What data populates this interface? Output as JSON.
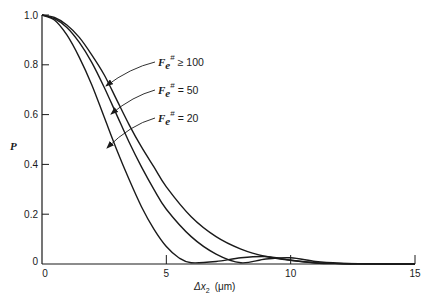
{
  "chart_data": {
    "type": "line",
    "title": "",
    "xlabel": "Δx₂ (μm)",
    "ylabel": "P",
    "xlim": [
      0,
      15
    ],
    "ylim": [
      0,
      1.0
    ],
    "x_ticks": [
      "0",
      "5",
      "10",
      "15"
    ],
    "y_ticks": [
      "0",
      "0.2",
      "0.4",
      "0.6",
      "0.8",
      "1.0"
    ],
    "grid": false,
    "legend_position": "annotations with arrows, center-right",
    "series": [
      {
        "name": "F_e# ≥ 100",
        "label_text": "≥ 100",
        "x": [
          0,
          0.5,
          1,
          1.5,
          2,
          2.5,
          3,
          3.5,
          4,
          4.5,
          5,
          6,
          7,
          8,
          9,
          10,
          11,
          12,
          13,
          14,
          15
        ],
        "y": [
          1.0,
          0.99,
          0.96,
          0.91,
          0.84,
          0.76,
          0.66,
          0.56,
          0.47,
          0.39,
          0.31,
          0.19,
          0.11,
          0.06,
          0.03,
          0.015,
          0.005,
          0.002,
          0.001,
          0.0,
          0.0
        ]
      },
      {
        "name": "F_e# = 50",
        "label_text": "= 50",
        "x": [
          0,
          0.5,
          1,
          1.5,
          2,
          2.5,
          3,
          3.5,
          4,
          4.5,
          5,
          6,
          7,
          8,
          9,
          10,
          11,
          12,
          13,
          14,
          15
        ],
        "y": [
          1.0,
          0.985,
          0.95,
          0.89,
          0.81,
          0.71,
          0.6,
          0.49,
          0.39,
          0.3,
          0.22,
          0.11,
          0.04,
          0.005,
          0.02,
          0.025,
          0.01,
          0.003,
          0.001,
          0.0,
          0.0
        ]
      },
      {
        "name": "F_e# = 20",
        "label_text": "= 20",
        "x": [
          0,
          0.5,
          1,
          1.5,
          2,
          2.5,
          3,
          3.5,
          4,
          4.5,
          5,
          5.5,
          6,
          7,
          8,
          9,
          10,
          11,
          12,
          13,
          14,
          15
        ],
        "y": [
          1.0,
          0.98,
          0.92,
          0.83,
          0.72,
          0.59,
          0.46,
          0.34,
          0.23,
          0.14,
          0.07,
          0.025,
          0.005,
          0.01,
          0.025,
          0.03,
          0.015,
          0.004,
          0.001,
          0.0,
          0.0,
          0.0
        ]
      }
    ]
  },
  "labels": {
    "ylabel": "P",
    "xlabel_delta": "Δx",
    "xlabel_sub": "2",
    "xlabel_unit": "(μm)",
    "legend_symbol": "F",
    "legend_sub": "e",
    "legend_sup": "#",
    "x_ticks": [
      "0",
      "5",
      "10",
      "15"
    ],
    "y_ticks": [
      "0",
      "0.2",
      "0.4",
      "0.6",
      "0.8",
      "1.0"
    ],
    "legend": [
      "≥ 100",
      "= 50",
      "= 20"
    ]
  },
  "colors": {
    "ink": "#1a1a1a",
    "background": "#ffffff"
  }
}
